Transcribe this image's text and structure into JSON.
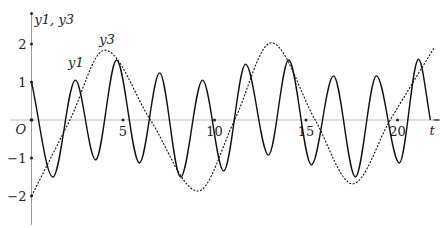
{
  "chart_data": {
    "type": "line",
    "title": "",
    "xlabel": "t",
    "ylabel": "y1, y3",
    "origin_label": "O",
    "xlim": [
      0,
      22.3
    ],
    "ylim": [
      -2.5,
      2.8
    ],
    "xticks": [
      5,
      10,
      15,
      20
    ],
    "xtick_labels": [
      "5",
      "10",
      "15",
      "20"
    ],
    "yticks": [
      2,
      1,
      -1,
      -2
    ],
    "ytick_labels": [
      "2",
      "1",
      "-1",
      "-2"
    ],
    "grid": false,
    "legend": "none",
    "annotations": [
      {
        "text": "y1",
        "series": "y1",
        "t": 2.0,
        "y": 1.4
      },
      {
        "text": "y3",
        "series": "y3",
        "t": 3.7,
        "y": 2.0
      }
    ],
    "series": [
      {
        "name": "y1",
        "style": "solid",
        "x": [
          0,
          1.17,
          2.4,
          3.5,
          4.65,
          5.9,
          7.0,
          8.15,
          9.35,
          10.5,
          11.7,
          12.95,
          14.05,
          15.3,
          16.5,
          17.7,
          18.85,
          20.1,
          21.15,
          21.8
        ],
        "y": [
          1.0,
          -1.5,
          1.05,
          -1.05,
          1.58,
          -1.13,
          1.24,
          -1.5,
          1.05,
          -1.34,
          1.47,
          -0.92,
          1.58,
          -1.18,
          1.16,
          -1.5,
          1.16,
          -1.13,
          1.6,
          0.0
        ]
      },
      {
        "name": "y3",
        "style": "dashed",
        "x": [
          0,
          2.1,
          4.0,
          6.5,
          9.1,
          11.1,
          13.1,
          15.5,
          17.55,
          19.6,
          22.0
        ],
        "y": [
          -2.0,
          0.0,
          1.84,
          0.0,
          -1.87,
          0.0,
          2.03,
          0.0,
          -1.68,
          0.0,
          1.9
        ]
      }
    ]
  }
}
